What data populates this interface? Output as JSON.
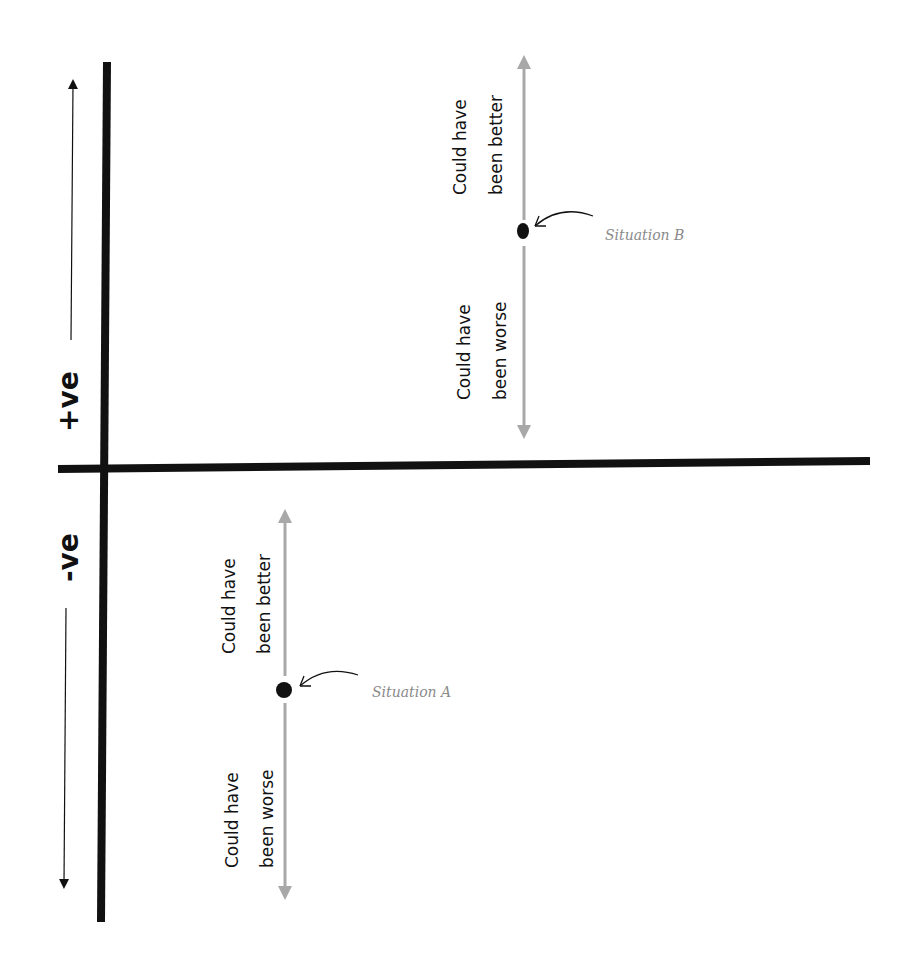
{
  "diagram": {
    "axis_labels": {
      "positive": "+ve",
      "negative": "-ve"
    },
    "spectrum_labels": {
      "better_line1": "Could have",
      "better_line2": "been better",
      "worse_line1": "Could have",
      "worse_line2": "been worse"
    },
    "situations": [
      {
        "label": "Situation B",
        "region": "positive"
      },
      {
        "label": "Situation A",
        "region": "negative"
      }
    ],
    "colors": {
      "axis": "#111111",
      "spectrum_arrow": "#a8a8a8",
      "situation_text": "#8a8a8a",
      "dot": "#111111"
    }
  }
}
